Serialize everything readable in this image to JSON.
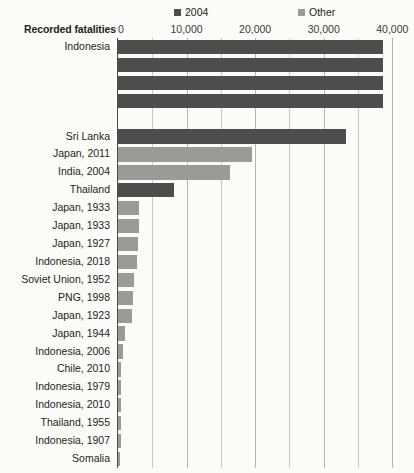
{
  "legend": {
    "items": [
      {
        "label": "2004",
        "color": "#4d4d4b",
        "icon": "square-swatch-icon"
      },
      {
        "label": "Other",
        "color": "#9a9a96",
        "icon": "square-swatch-icon"
      }
    ]
  },
  "axis": {
    "title": "Recorded fatalities",
    "ticks": [
      "0",
      "10,000",
      "20,000",
      "30,000",
      "40,000"
    ]
  },
  "chart_data": {
    "type": "bar",
    "orientation": "horizontal",
    "title": "",
    "subtitle": "",
    "xlabel": "Recorded fatalities",
    "ylabel": "",
    "xlim": [
      0,
      42000
    ],
    "xticks": [
      0,
      10000,
      20000,
      30000,
      40000
    ],
    "xtick_labels": [
      "0",
      "10,000",
      "20,000",
      "30,000",
      "40,000"
    ],
    "minor_gridline_step": 5000,
    "grid": true,
    "legend_position": "top",
    "note": "Top Indonesia bars extend beyond the plotted axis range (clipped).",
    "series": [
      {
        "name": "2004",
        "color": "#4d4d4b"
      },
      {
        "name": "Other",
        "color": "#9a9a96"
      }
    ],
    "categories": [
      "Indonesia",
      "",
      "",
      "",
      "",
      "Sri Lanka",
      "Japan, 2011",
      "India, 2004",
      "Thailand",
      "Japan, 1933",
      "Japan, 1933",
      "Japan, 1927",
      "Indonesia, 2018",
      "Soviet Union, 1952",
      "PNG, 1998",
      "Japan, 1923",
      "Japan, 1944",
      "Indonesia, 2006",
      "Chile, 2010",
      "Indonesia, 1979",
      "Indonesia, 2010",
      "Thailand, 1955",
      "Indonesia, 1907",
      "Somalia"
    ],
    "bars": [
      {
        "label": "Indonesia",
        "value": 38700,
        "series": "2004",
        "clipped": true
      },
      {
        "label": "",
        "value": 38700,
        "series": "2004",
        "clipped": true
      },
      {
        "label": "",
        "value": 38700,
        "series": "2004",
        "clipped": true
      },
      {
        "label": "",
        "value": 38700,
        "series": "2004",
        "clipped": true
      },
      {
        "label": "",
        "value": 0,
        "series": "2004",
        "clipped": false
      },
      {
        "label": "Sri Lanka",
        "value": 33200,
        "series": "2004",
        "clipped": false
      },
      {
        "label": "Japan, 2011",
        "value": 19600,
        "series": "Other",
        "clipped": false
      },
      {
        "label": "India, 2004",
        "value": 16400,
        "series": "Other",
        "clipped": false
      },
      {
        "label": "Thailand",
        "value": 8200,
        "series": "2004",
        "clipped": false
      },
      {
        "label": "Japan, 1933",
        "value": 3100,
        "series": "Other",
        "clipped": false
      },
      {
        "label": "Japan, 1933",
        "value": 3000,
        "series": "Other",
        "clipped": false
      },
      {
        "label": "Japan, 1927",
        "value": 2900,
        "series": "Other",
        "clipped": false
      },
      {
        "label": "Indonesia, 2018",
        "value": 2700,
        "series": "Other",
        "clipped": false
      },
      {
        "label": "Soviet Union, 1952",
        "value": 2400,
        "series": "Other",
        "clipped": false
      },
      {
        "label": "PNG, 1998",
        "value": 2200,
        "series": "Other",
        "clipped": false
      },
      {
        "label": "Japan, 1923",
        "value": 2100,
        "series": "Other",
        "clipped": false
      },
      {
        "label": "Japan, 1944",
        "value": 1000,
        "series": "Other",
        "clipped": false
      },
      {
        "label": "Indonesia, 2006",
        "value": 800,
        "series": "Other",
        "clipped": false
      },
      {
        "label": "Chile, 2010",
        "value": 500,
        "series": "Other",
        "clipped": false
      },
      {
        "label": "Indonesia, 1979",
        "value": 450,
        "series": "Other",
        "clipped": false
      },
      {
        "label": "Indonesia, 2010",
        "value": 430,
        "series": "Other",
        "clipped": false
      },
      {
        "label": "Thailand, 1955",
        "value": 400,
        "series": "Other",
        "clipped": false
      },
      {
        "label": "Indonesia, 1907",
        "value": 400,
        "series": "Other",
        "clipped": false
      },
      {
        "label": "Somalia",
        "value": 300,
        "series": "Other",
        "clipped": false
      }
    ]
  }
}
